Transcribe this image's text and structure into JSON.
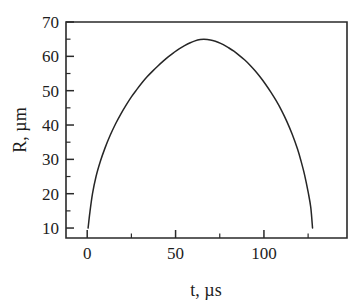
{
  "figure": {
    "background_color": "#ffffff",
    "line_color": "#262626",
    "text_color": "#1d1d1d"
  },
  "chart_data": {
    "type": "line",
    "title": "",
    "subtitle": "",
    "xlabel": "t, µs",
    "ylabel": "R, µm",
    "xlim": [
      -12,
      147
    ],
    "ylim": [
      7.1,
      70
    ],
    "grid": false,
    "legend": null,
    "x_major_ticks": [
      0,
      50,
      100
    ],
    "x_major_tick_labels": [
      "0",
      "50",
      "100"
    ],
    "x_minor_ticks": [
      25,
      75,
      125
    ],
    "y_major_ticks": [
      10,
      20,
      30,
      40,
      50,
      60,
      70
    ],
    "y_major_tick_labels": [
      "10",
      "20",
      "30",
      "40",
      "50",
      "60",
      "70"
    ],
    "y_minor_ticks": [
      15,
      25,
      35,
      45,
      55,
      65
    ],
    "series": [
      {
        "name": "bubble radius",
        "x": [
          0.5,
          1.5,
          3,
          5,
          7.5,
          10,
          13,
          16,
          19,
          22,
          25,
          28,
          31,
          34,
          37,
          40,
          43,
          46,
          49,
          52,
          55,
          58,
          61,
          64,
          66,
          68,
          71,
          74,
          77,
          80,
          83,
          86,
          89,
          92,
          95,
          98,
          101,
          104,
          107,
          110,
          113,
          116,
          119,
          121,
          123,
          125,
          126.5,
          127.5
        ],
        "y": [
          10.0,
          14.5,
          20.0,
          25.0,
          29.5,
          33.2,
          37.0,
          40.3,
          43.2,
          45.8,
          48.2,
          50.3,
          52.3,
          54.1,
          55.7,
          57.2,
          58.6,
          59.9,
          61.1,
          62.2,
          63.1,
          63.9,
          64.5,
          64.9,
          65.0,
          64.9,
          64.6,
          64.1,
          63.4,
          62.5,
          61.5,
          60.3,
          59.0,
          57.5,
          55.8,
          53.9,
          51.8,
          49.5,
          47.0,
          44.2,
          41.0,
          37.3,
          33.0,
          29.5,
          25.5,
          20.5,
          16.0,
          10.0
        ]
      }
    ],
    "annotations": [
      {
        "label": "peak radius",
        "x": 66,
        "y": 65.0
      },
      {
        "label": "start radius",
        "x": 0.5,
        "y": 10.0
      },
      {
        "label": "end radius",
        "x": 127.5,
        "y": 10.0
      }
    ]
  }
}
